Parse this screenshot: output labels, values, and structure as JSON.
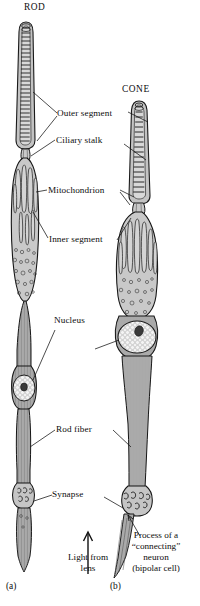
{
  "figure": {
    "title_rod": "ROD",
    "title_cone": "CONE",
    "panel_a": "(a)",
    "panel_b": "(b)"
  },
  "labels": {
    "outer_segment": "Outer segment",
    "ciliary_stalk": "Ciliary stalk",
    "mitochondrion": "Mitochondrion",
    "inner_segment": "Inner segment",
    "nucleus": "Nucleus",
    "rod_fiber": "Rod fiber",
    "synapse": "Synapse"
  },
  "light": {
    "line1": "Light from",
    "line2": "lens",
    "arrow": "up-arrow-icon"
  },
  "bipolar": {
    "line1": "Process of a",
    "line2": "“connecting”",
    "line3": "neuron",
    "line4": "(bipolar cell)"
  },
  "colors": {
    "ink": "#111111",
    "cell_fill": "#b9b9b9",
    "cell_fill_light": "#cccccc",
    "nucleus_fill": "#f2f2f2",
    "nucleolus": "#3a3a3a",
    "background": "#ffffff"
  }
}
